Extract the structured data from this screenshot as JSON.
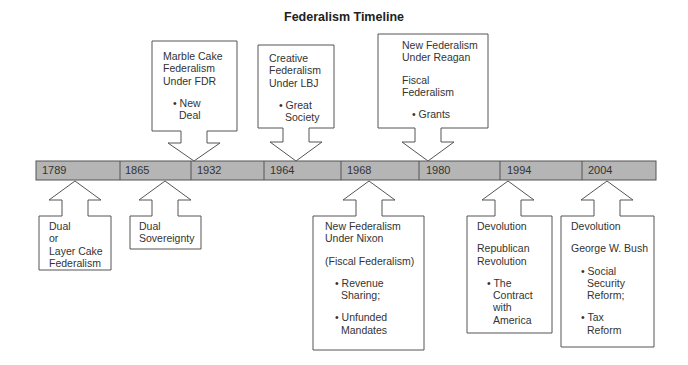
{
  "title": "Federalism Timeline",
  "colors": {
    "bar_fill": "#b5b5b5",
    "bar_stroke": "#555555",
    "box_stroke": "#555555",
    "text": "#333333"
  },
  "timeline": {
    "years": [
      "1789",
      "1865",
      "1932",
      "1964",
      "1968",
      "1980",
      "1994",
      "2004"
    ]
  },
  "above": [
    {
      "year": "1932",
      "lines": [
        "Marble Cake",
        "Federalism",
        "Under FDR"
      ],
      "bullets": [
        [
          "New",
          "Deal"
        ]
      ]
    },
    {
      "year": "1964",
      "lines": [
        "Creative",
        "Federalism",
        "Under LBJ"
      ],
      "bullets": [
        [
          "Great",
          "Society"
        ]
      ]
    },
    {
      "year": "1980",
      "lines": [
        "New Federalism",
        "Under Reagan"
      ],
      "lines2": [
        "Fiscal",
        "Federalism"
      ],
      "bullets": [
        [
          "Grants"
        ]
      ]
    }
  ],
  "below": [
    {
      "year": "1789",
      "lines": [
        "Dual",
        "or",
        "Layer Cake",
        "Federalism"
      ]
    },
    {
      "year": "1865",
      "lines": [
        "Dual",
        "Sovereignty"
      ]
    },
    {
      "year": "1968",
      "lines": [
        "New Federalism",
        "Under Nixon"
      ],
      "lines2": [
        "(Fiscal Federalism)"
      ],
      "bullets": [
        [
          "Revenue",
          "Sharing;"
        ],
        [
          "Unfunded",
          "Mandates"
        ]
      ]
    },
    {
      "year": "1994",
      "lines": [
        "Devolution"
      ],
      "lines2": [
        "Republican",
        "Revolution"
      ],
      "bullets": [
        [
          "The",
          "Contract",
          "with",
          "America"
        ]
      ]
    },
    {
      "year": "2004",
      "lines": [
        "Devolution"
      ],
      "lines2": [
        "George W. Bush"
      ],
      "bullets": [
        [
          "Social",
          "Security",
          "Reform;"
        ],
        [
          "Tax",
          "Reform"
        ]
      ]
    }
  ]
}
